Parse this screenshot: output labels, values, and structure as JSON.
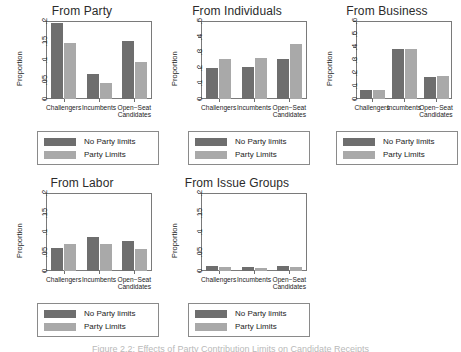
{
  "figure": {
    "caption": "Figure 2.2: Effects of Party Contribution Limits on Candidate Receipts",
    "legend": {
      "series_dark": "No Party limits",
      "series_light": "Party Limits"
    },
    "colors": {
      "dark": "#6e6e6e",
      "light": "#a9a9a9",
      "axis": "#7a7a7a",
      "text": "#1c1c1c"
    }
  },
  "chart_data": [
    {
      "type": "bar",
      "title": "From Party",
      "xlabel": "",
      "ylabel": "Proportion",
      "categories": [
        "Challengers",
        "Incumbents",
        "Open−Seat\nCandidates"
      ],
      "series": [
        {
          "name": "No Party limits",
          "values": [
            0.196,
            0.063,
            0.149
          ]
        },
        {
          "name": "Party Limits",
          "values": [
            0.144,
            0.042,
            0.096
          ]
        }
      ],
      "ylim": [
        0,
        0.2
      ],
      "yticks": [
        0,
        0.05,
        0.1,
        0.15,
        0.2
      ],
      "ytick_labels": [
        "0",
        ".05",
        ".1",
        ".15",
        ".2"
      ],
      "grid": false,
      "legend_position": "below"
    },
    {
      "type": "bar",
      "title": "From Individuals",
      "xlabel": "",
      "ylabel": "Proportion",
      "categories": [
        "Challengers",
        "Incumbents",
        "Open−Seat\nCandidates"
      ],
      "series": [
        {
          "name": "No Party limits",
          "values": [
            0.199,
            0.204,
            0.256
          ]
        },
        {
          "name": "Party Limits",
          "values": [
            0.256,
            0.263,
            0.351
          ]
        }
      ],
      "ylim": [
        0,
        0.5
      ],
      "yticks": [
        0,
        0.1,
        0.2,
        0.3,
        0.4,
        0.5
      ],
      "ytick_labels": [
        "0",
        ".1",
        ".2",
        ".3",
        ".4",
        ".5"
      ],
      "grid": false,
      "legend_position": "below"
    },
    {
      "type": "bar",
      "title": "From Business",
      "xlabel": "",
      "ylabel": "Proportion",
      "categories": [
        "Challengers",
        "Incumbents",
        "Open−Seat\nCandidates"
      ],
      "series": [
        {
          "name": "No Party limits",
          "values": [
            0.072,
            0.383,
            0.172
          ]
        },
        {
          "name": "Party Limits",
          "values": [
            0.066,
            0.381,
            0.177
          ]
        }
      ],
      "ylim": [
        0,
        0.6
      ],
      "yticks": [
        0,
        0.1,
        0.2,
        0.3,
        0.4,
        0.5,
        0.6
      ],
      "ytick_labels": [
        "0",
        ".1",
        ".2",
        ".3",
        ".4",
        ".5",
        ".6"
      ],
      "grid": false,
      "legend_position": "below"
    },
    {
      "type": "bar",
      "title": "From Labor",
      "xlabel": "",
      "ylabel": "Proportion",
      "categories": [
        "Challengers",
        "Incumbents",
        "Open−Seat\nCandidates"
      ],
      "series": [
        {
          "name": "No Party limits",
          "values": [
            0.058,
            0.088,
            0.076
          ]
        },
        {
          "name": "Party Limits",
          "values": [
            0.068,
            0.068,
            0.057
          ]
        }
      ],
      "ylim": [
        0,
        0.2
      ],
      "yticks": [
        0,
        0.05,
        0.1,
        0.15,
        0.2
      ],
      "ytick_labels": [
        "0",
        ".05",
        ".1",
        ".15",
        ".2"
      ],
      "grid": false,
      "legend_position": "below"
    },
    {
      "type": "bar",
      "title": "From Issue Groups",
      "xlabel": "",
      "ylabel": "Proportion",
      "categories": [
        "Challengers",
        "Incumbents",
        "Open−Seat\nCandidates"
      ],
      "series": [
        {
          "name": "No Party limits",
          "values": [
            0.014,
            0.009,
            0.013
          ]
        },
        {
          "name": "Party Limits",
          "values": [
            0.01,
            0.008,
            0.009
          ]
        }
      ],
      "ylim": [
        0,
        0.2
      ],
      "yticks": [
        0,
        0.05,
        0.1,
        0.15,
        0.2
      ],
      "ytick_labels": [
        "0",
        ".05",
        ".1",
        ".15",
        ".2"
      ],
      "grid": false,
      "legend_position": "below"
    }
  ]
}
